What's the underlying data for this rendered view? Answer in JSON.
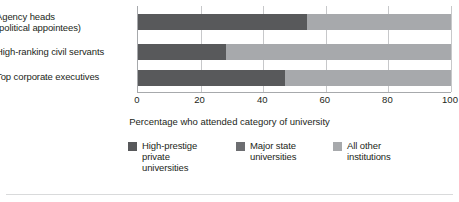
{
  "chart_data": {
    "type": "bar",
    "orientation": "horizontal",
    "stacked": true,
    "title": "",
    "xlabel": "Percentage who attended category of university",
    "ylabel": "",
    "xlim": [
      0,
      100
    ],
    "xticks": [
      0,
      20,
      40,
      60,
      80,
      100
    ],
    "xtick_labels": [
      "0",
      "20",
      "40",
      "60",
      "80",
      "100"
    ],
    "grid": true,
    "legend_position": "bottom",
    "categories": [
      "Agency heads\n(political appointees)",
      "High-ranking civil servants",
      "Top corporate executives"
    ],
    "series": [
      {
        "name": "High-prestige\nprivate\nuniversities",
        "color": "#58595b",
        "values": [
          54,
          28,
          47
        ]
      },
      {
        "name": "Major state\nuniversities",
        "color": "#6d6e71",
        "values": [
          0,
          0,
          0
        ]
      },
      {
        "name": "All other\ninstitutions",
        "color": "#a7a9ac",
        "values": [
          46,
          72,
          53
        ]
      }
    ]
  },
  "axis": {
    "title": "Percentage who attended category of university",
    "ticks": [
      "0",
      "20",
      "40",
      "60",
      "80",
      "100"
    ]
  },
  "legend": {
    "items": [
      {
        "label": "High-prestige\nprivate\nuniversities",
        "color": "#58595b"
      },
      {
        "label": "Major state\nuniversities",
        "color": "#6d6e71"
      },
      {
        "label": "All other\ninstitutions",
        "color": "#a7a9ac"
      }
    ]
  },
  "categories": [
    "Agency heads\n(political appointees)",
    "High-ranking civil servants",
    "Top corporate executives"
  ],
  "colors": {
    "high_prestige": "#58595b",
    "major_state": "#6d6e71",
    "all_other": "#a7a9ac",
    "grid": "#c7c8ca",
    "axis": "#a7a9ac",
    "text": "#231f20",
    "background": "#ffffff",
    "rule": "#d9dadb"
  }
}
